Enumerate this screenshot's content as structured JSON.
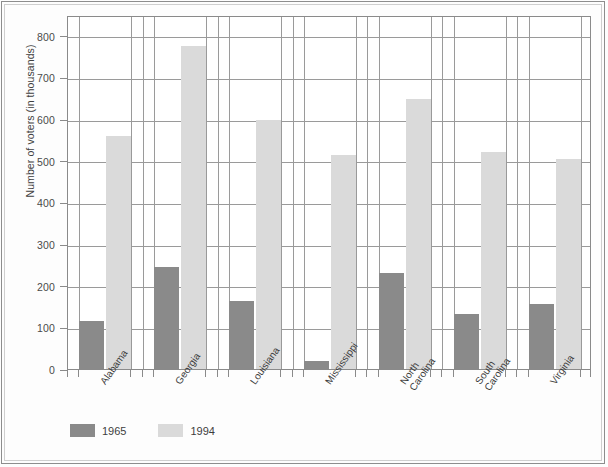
{
  "chart_data": {
    "type": "bar",
    "title": "",
    "subtitle": "",
    "xlabel": "",
    "ylabel": "Number of voters (in thousands)",
    "ylim": [
      0,
      850
    ],
    "yticks": [
      0,
      100,
      200,
      300,
      400,
      500,
      600,
      700,
      800
    ],
    "ytick_labels": [
      "0",
      "100",
      "200",
      "300",
      "400",
      "500",
      "600",
      "700",
      "800"
    ],
    "grid": "horizontal-and-vertical",
    "legend_position": "below-axes-left",
    "categories": [
      "Alabama",
      "Georgia",
      "Louisiana",
      "Mississippi",
      "North\nCarolina",
      "South\nCarolina",
      "Virginia"
    ],
    "series": [
      {
        "name": "1965",
        "color": "#8a8a8a",
        "values": [
          115,
          245,
          163,
          19,
          230,
          132,
          155
        ]
      },
      {
        "name": "1994",
        "color": "#dadada",
        "values": [
          560,
          775,
          598,
          515,
          648,
          520,
          505
        ]
      }
    ],
    "annotations": []
  },
  "legend": {
    "items": [
      {
        "label": "1965",
        "color": "#8a8a8a",
        "swatch_name": "legend-swatch-1965"
      },
      {
        "label": "1994",
        "color": "#dadada",
        "swatch_name": "legend-swatch-1994"
      }
    ]
  },
  "axes": {
    "y_title": "Number of voters (in thousands)"
  }
}
